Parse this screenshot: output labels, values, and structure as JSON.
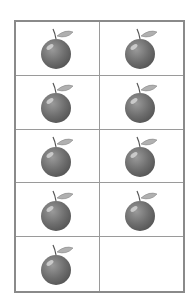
{
  "grid": {
    "rows": 5,
    "columns": 2,
    "cells": [
      {
        "item": "apple-icon"
      },
      {
        "item": "apple-icon"
      },
      {
        "item": "apple-icon"
      },
      {
        "item": "apple-icon"
      },
      {
        "item": "apple-icon"
      },
      {
        "item": "apple-icon"
      },
      {
        "item": "apple-icon"
      },
      {
        "item": "apple-icon"
      },
      {
        "item": "apple-icon"
      },
      {
        "item": null
      }
    ],
    "count": 9
  },
  "colors": {
    "fruit": "#6e6e6e",
    "leaf": "#a9a9a9",
    "border": "#8a8a8a"
  }
}
